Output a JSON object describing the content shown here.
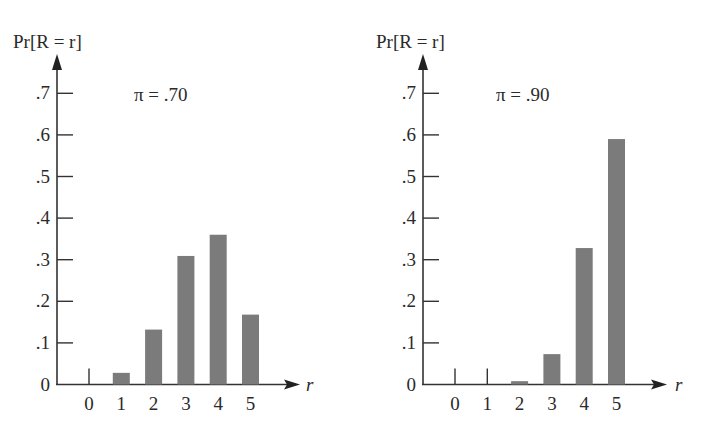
{
  "chart_data": [
    {
      "type": "bar",
      "title": "π = .70",
      "ylabel": "Pr[R = r]",
      "xlabel": "r",
      "categories": [
        "0",
        "1",
        "2",
        "3",
        "4",
        "5"
      ],
      "values": [
        0.002,
        0.028,
        0.132,
        0.309,
        0.36,
        0.168
      ],
      "yticks": [
        ".7",
        ".6",
        ".5",
        ".4",
        ".3",
        ".2",
        ".1",
        "0"
      ],
      "ylim": [
        0,
        0.75
      ],
      "grid": false,
      "bar_color": "#7b7b7b"
    },
    {
      "type": "bar",
      "title": "π = .90",
      "ylabel": "Pr[R = r]",
      "xlabel": "r",
      "categories": [
        "0",
        "1",
        "2",
        "3",
        "4",
        "5"
      ],
      "values": [
        0.0,
        0.0,
        0.008,
        0.073,
        0.328,
        0.59
      ],
      "yticks": [
        ".7",
        ".6",
        ".5",
        ".4",
        ".3",
        ".2",
        ".1",
        "0"
      ],
      "ylim": [
        0,
        0.75
      ],
      "grid": false,
      "bar_color": "#7b7b7b"
    }
  ]
}
